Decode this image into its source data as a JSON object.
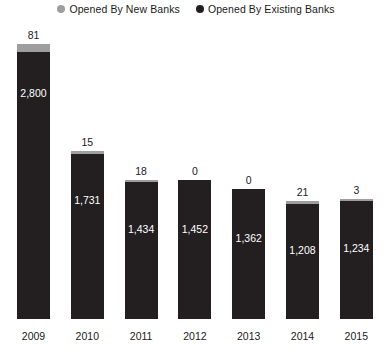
{
  "legend": {
    "items": [
      {
        "label": "Opened By New Banks",
        "color": "#9e9e9e",
        "marker": "circle-marker-icon"
      },
      {
        "label": "Opened By Existing Banks",
        "color": "#231f20",
        "marker": "circle-marker-icon"
      }
    ]
  },
  "colors": {
    "new_banks": "#9e9e9e",
    "existing_banks": "#231f20",
    "text": "#1a1a1a",
    "inner_text": "#ffffff",
    "background": "#ffffff"
  },
  "chart_data": {
    "type": "bar",
    "title": "",
    "subtitle": "",
    "xlabel": "",
    "ylabel": "",
    "grid": false,
    "legend_position": "top-center",
    "stacked": true,
    "ylim": [
      0,
      2881
    ],
    "categories": [
      "2009",
      "2010",
      "2011",
      "2012",
      "2013",
      "2014",
      "2015"
    ],
    "series": [
      {
        "name": "Opened By Existing Banks",
        "color": "#231f20",
        "values": [
          2800,
          1731,
          1434,
          1452,
          1362,
          1208,
          1234
        ],
        "labels": [
          "2,800",
          "1,731",
          "1,434",
          "1,452",
          "1,362",
          "1,208",
          "1,234"
        ]
      },
      {
        "name": "Opened By New Banks",
        "color": "#9e9e9e",
        "values": [
          81,
          15,
          18,
          0,
          0,
          21,
          3
        ],
        "labels": [
          "81",
          "15",
          "18",
          "0",
          "0",
          "21",
          "3"
        ]
      }
    ],
    "totals": [
      2881,
      1746,
      1452,
      1452,
      1362,
      1229,
      1237
    ]
  }
}
